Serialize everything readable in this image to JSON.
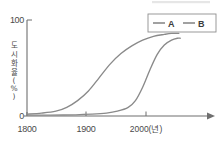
{
  "chart_data": {
    "type": "line",
    "title": "",
    "xlabel": "2000(년)",
    "ylabel": "도시화율(%)",
    "xlim": [
      1800,
      2020
    ],
    "ylim": [
      0,
      100
    ],
    "grid": false,
    "legend_position": "top-right",
    "x_ticks": [
      "1800",
      "1900",
      "2000(년)"
    ],
    "x_tick_values": [
      1800,
      1900,
      2000
    ],
    "y_ticks": [
      "0",
      "100"
    ],
    "y_tick_values": [
      0,
      100
    ],
    "series": [
      {
        "name": "A",
        "color": "#8a8a8a",
        "x": [
          1800,
          1820,
          1840,
          1855,
          1870,
          1885,
          1900,
          1915,
          1930,
          1945,
          1960,
          1975,
          1990,
          2000,
          2010
        ],
        "values": [
          2,
          3,
          5,
          9,
          16,
          26,
          40,
          54,
          65,
          73,
          79,
          83,
          85,
          86,
          86
        ]
      },
      {
        "name": "B",
        "color": "#8a8a8a",
        "x": [
          1800,
          1850,
          1890,
          1910,
          1925,
          1940,
          1950,
          1960,
          1970,
          1980,
          1990,
          2000,
          2008,
          2012
        ],
        "values": [
          1,
          1,
          2,
          3,
          5,
          9,
          16,
          30,
          48,
          64,
          74,
          79,
          81,
          81
        ]
      }
    ]
  },
  "legend": {
    "items": [
      {
        "label": "A",
        "dash_color": "#8a8a8a"
      },
      {
        "label": "B",
        "dash_color": "#8a8a8a"
      }
    ]
  },
  "axes": {
    "y_top_label": "100",
    "y_zero_label": "0",
    "x_first_label": "1800",
    "x_mid_label": "1900",
    "x_last_label": "2000(년)",
    "y_axis_title_chars": [
      "도",
      "시",
      "화",
      "율",
      "(",
      "%",
      ")"
    ]
  },
  "colors": {
    "ink": "#6f6f6f",
    "text": "#4a4a4a",
    "curve": "#8a8a8a",
    "background": "#ffffff"
  }
}
